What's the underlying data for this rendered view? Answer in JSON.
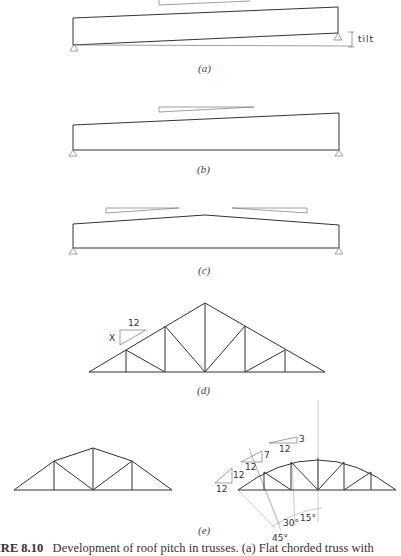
{
  "figure": {
    "panels": [
      {
        "id": "a",
        "label": "(a)",
        "annotation": "tilt",
        "description": "Flat chorded truss tilted on supports"
      },
      {
        "id": "b",
        "label": "(b)",
        "description": "Single-slope truss with raised top chord"
      },
      {
        "id": "c",
        "label": "(c)",
        "description": "Double-slope (gable) truss with low pitch"
      },
      {
        "id": "d",
        "label": "(d)",
        "pitch_rise": "X",
        "pitch_run": "12",
        "description": "Pitched triangular truss"
      },
      {
        "id": "e",
        "label": "(e)",
        "description": "Bowstring-type trusses with varying slopes",
        "slopes": [
          {
            "rise": "12",
            "run": "12"
          },
          {
            "rise": "7",
            "run": "12"
          },
          {
            "rise": "3",
            "run": "12"
          }
        ],
        "angles": [
          "45°",
          "30°",
          "15°"
        ]
      }
    ],
    "caption": {
      "number": "IRE 8.10",
      "text": "Development of roof pitch in trusses. (a) Flat chorded truss with"
    }
  }
}
